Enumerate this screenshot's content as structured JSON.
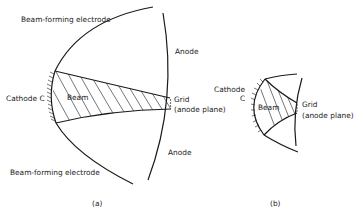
{
  "diagram_a": {
    "beam_electrode_top": "Beam-forming electrode",
    "beam_electrode_bottom": "Beam-forming electrode",
    "anode_top": "Anode",
    "anode_bottom": "Anode",
    "cathode": "Cathode C",
    "beam": "Beam",
    "grid": "Grid",
    "grid_sub": "(anode plane)",
    "caption": "(a)"
  },
  "diagram_b": {
    "cathode_line1": "Cathode",
    "cathode_line2": "C",
    "beam": "Beam",
    "grid": "Grid",
    "grid_sub": "(anode plane)",
    "caption": "(b)"
  }
}
